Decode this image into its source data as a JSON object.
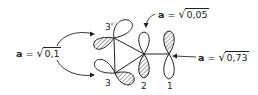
{
  "diagram": {
    "atoms": [
      {
        "id": "3prime",
        "label": "3'"
      },
      {
        "id": "3",
        "label": "3"
      },
      {
        "id": "2",
        "label": "2"
      },
      {
        "id": "1",
        "label": "1"
      }
    ],
    "coefficients": [
      {
        "target": "3 and 3'",
        "symbol": "a",
        "equals": "=",
        "root": "√",
        "value": "0,1"
      },
      {
        "target": "2",
        "symbol": "a",
        "equals": "=",
        "root": "√",
        "value": "0,05"
      },
      {
        "target": "1",
        "symbol": "a",
        "equals": "=",
        "root": "√",
        "value": "0,73"
      }
    ],
    "colors": {
      "line": "#222222",
      "background": "#ffffff"
    }
  }
}
